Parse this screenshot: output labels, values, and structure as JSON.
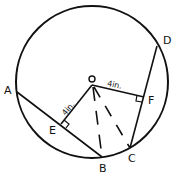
{
  "diagram": {
    "type": "geometry-circle-chords",
    "points": {
      "O": "O",
      "A": "A",
      "B": "B",
      "C": "C",
      "D": "D",
      "E": "E",
      "F": "F"
    },
    "measurements": {
      "OE": "4in.",
      "OF": "4in."
    },
    "segments": [
      "AB",
      "CD",
      "OE",
      "OF",
      "OB (dashed)",
      "OC (dashed)"
    ],
    "right_angles": [
      "E",
      "F"
    ],
    "colors": {
      "stroke": "#111111",
      "background": "#ffffff"
    }
  }
}
